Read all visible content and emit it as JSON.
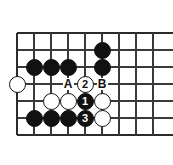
{
  "figure": {
    "kind": "go-board-diagram",
    "title": "",
    "colors": {
      "background": "#ffffff",
      "line": "#3a3a3a",
      "edge_line": "#2b2b2b",
      "black_stone": "#111111",
      "white_stone": "#ffffff",
      "stone_outline": "#111111"
    },
    "board": {
      "x_lines": [
        17,
        34,
        51,
        68,
        85,
        102,
        119,
        136,
        153
      ],
      "y_lines": [
        33,
        50,
        67,
        84,
        101,
        118,
        135
      ],
      "spacing": 17,
      "edges": {
        "left": 17,
        "top": 33,
        "bottom": 135
      },
      "stone_radius": 8.5
    },
    "stones": [
      {
        "id": "b-f2",
        "color": "black",
        "label": "",
        "cx": 102,
        "cy": 50
      },
      {
        "id": "b-b3",
        "color": "black",
        "label": "",
        "cx": 34,
        "cy": 67
      },
      {
        "id": "b-c3",
        "color": "black",
        "label": "",
        "cx": 51,
        "cy": 67
      },
      {
        "id": "b-d3",
        "color": "black",
        "label": "",
        "cx": 68,
        "cy": 67
      },
      {
        "id": "b-f3",
        "color": "black",
        "label": "",
        "cx": 102,
        "cy": 67
      },
      {
        "id": "w-a4",
        "color": "white",
        "label": "",
        "cx": 17,
        "cy": 84
      },
      {
        "id": "w-e4",
        "color": "white",
        "label": "2",
        "cx": 85,
        "cy": 84
      },
      {
        "id": "w-c5",
        "color": "white",
        "label": "",
        "cx": 51,
        "cy": 101
      },
      {
        "id": "w-d5",
        "color": "white",
        "label": "",
        "cx": 68,
        "cy": 101
      },
      {
        "id": "b-e5",
        "color": "black",
        "label": "1",
        "cx": 85,
        "cy": 101
      },
      {
        "id": "w-f5",
        "color": "white",
        "label": "",
        "cx": 102,
        "cy": 101
      },
      {
        "id": "b-b6",
        "color": "black",
        "label": "",
        "cx": 34,
        "cy": 118
      },
      {
        "id": "b-c6",
        "color": "black",
        "label": "",
        "cx": 51,
        "cy": 118
      },
      {
        "id": "b-d6",
        "color": "black",
        "label": "",
        "cx": 68,
        "cy": 118
      },
      {
        "id": "b-e6",
        "color": "black",
        "label": "3",
        "cx": 85,
        "cy": 118
      },
      {
        "id": "w-f6",
        "color": "white",
        "label": "",
        "cx": 102,
        "cy": 118
      }
    ],
    "point_markers": [
      {
        "id": "marker-a",
        "label": "A",
        "cx": 68,
        "cy": 84
      },
      {
        "id": "marker-b",
        "label": "B",
        "cx": 102,
        "cy": 84
      }
    ],
    "move_sequence": [
      {
        "number": "1",
        "color": "black"
      },
      {
        "number": "2",
        "color": "white"
      },
      {
        "number": "3",
        "color": "black"
      }
    ]
  }
}
